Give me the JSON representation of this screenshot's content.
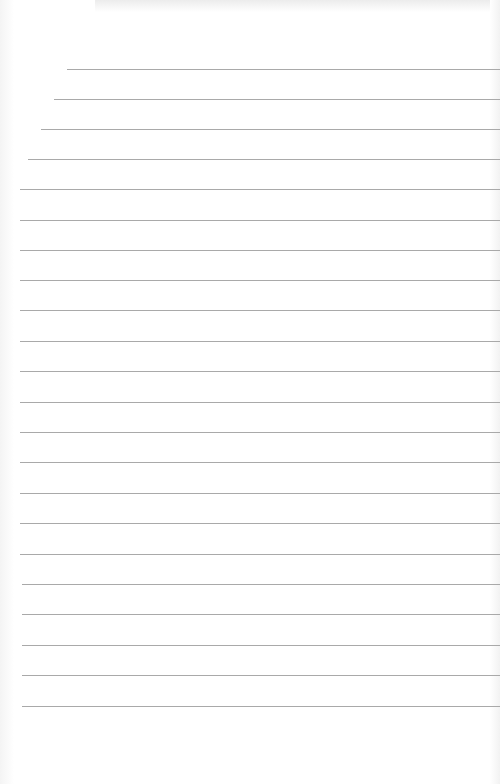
{
  "page": {
    "type": "lined-paper",
    "background_color": "#ffffff",
    "line_color": "#a9a9a9"
  },
  "lines": [
    {
      "y": 69,
      "left": 67
    },
    {
      "y": 99,
      "left": 54
    },
    {
      "y": 129,
      "left": 41
    },
    {
      "y": 159,
      "left": 28
    },
    {
      "y": 189,
      "left": 20
    },
    {
      "y": 220,
      "left": 20
    },
    {
      "y": 250,
      "left": 20
    },
    {
      "y": 280,
      "left": 20
    },
    {
      "y": 310,
      "left": 20
    },
    {
      "y": 341,
      "left": 20
    },
    {
      "y": 371,
      "left": 20
    },
    {
      "y": 402,
      "left": 20
    },
    {
      "y": 432,
      "left": 20
    },
    {
      "y": 462,
      "left": 20
    },
    {
      "y": 493,
      "left": 20
    },
    {
      "y": 523,
      "left": 20
    },
    {
      "y": 554,
      "left": 20
    },
    {
      "y": 584,
      "left": 22
    },
    {
      "y": 614,
      "left": 22
    },
    {
      "y": 645,
      "left": 22
    },
    {
      "y": 675,
      "left": 22
    },
    {
      "y": 706,
      "left": 22
    }
  ]
}
